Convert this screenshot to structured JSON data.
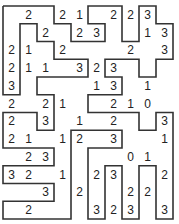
{
  "puzzle": {
    "type": "slitherlink",
    "cols": 10,
    "rows": 12,
    "line_color": "#333333",
    "clues": [
      [
        null,
        2,
        null,
        2,
        1,
        null,
        2,
        2,
        3,
        null
      ],
      [
        null,
        null,
        2,
        null,
        2,
        3,
        null,
        null,
        1,
        3
      ],
      [
        2,
        1,
        null,
        2,
        null,
        null,
        null,
        2,
        null,
        3
      ],
      [
        2,
        1,
        1,
        null,
        3,
        2,
        3,
        null,
        null,
        null
      ],
      [
        3,
        null,
        null,
        null,
        null,
        1,
        3,
        null,
        1,
        null
      ],
      [
        2,
        null,
        2,
        1,
        null,
        null,
        2,
        1,
        0,
        null
      ],
      [
        2,
        null,
        3,
        null,
        1,
        null,
        2,
        null,
        null,
        3
      ],
      [
        2,
        1,
        null,
        1,
        2,
        null,
        3,
        null,
        null,
        1
      ],
      [
        null,
        2,
        3,
        null,
        null,
        null,
        null,
        0,
        1,
        null
      ],
      [
        3,
        2,
        null,
        1,
        null,
        2,
        3,
        null,
        null,
        2
      ],
      [
        null,
        null,
        3,
        null,
        2,
        null,
        null,
        2,
        2,
        null
      ],
      [
        null,
        2,
        null,
        null,
        null,
        3,
        2,
        3,
        null,
        3
      ]
    ],
    "loop": [
      [
        0,
        0
      ],
      [
        3,
        0
      ],
      [
        3,
        1
      ],
      [
        4,
        1
      ],
      [
        4,
        2
      ],
      [
        6,
        2
      ],
      [
        6,
        1
      ],
      [
        5,
        1
      ],
      [
        5,
        0
      ],
      [
        7,
        0
      ],
      [
        7,
        2
      ],
      [
        8,
        2
      ],
      [
        8,
        0
      ],
      [
        9,
        0
      ],
      [
        9,
        1
      ],
      [
        10,
        1
      ],
      [
        10,
        3
      ],
      [
        9,
        3
      ],
      [
        9,
        4
      ],
      [
        8,
        4
      ],
      [
        8,
        3
      ],
      [
        6,
        3
      ],
      [
        6,
        4
      ],
      [
        7,
        4
      ],
      [
        7,
        5
      ],
      [
        5,
        5
      ],
      [
        5,
        6
      ],
      [
        8,
        6
      ],
      [
        8,
        7
      ],
      [
        9,
        7
      ],
      [
        9,
        6
      ],
      [
        10,
        6
      ],
      [
        10,
        12
      ],
      [
        9,
        12
      ],
      [
        9,
        9
      ],
      [
        8,
        9
      ],
      [
        8,
        12
      ],
      [
        7,
        12
      ],
      [
        7,
        9
      ],
      [
        6,
        9
      ],
      [
        6,
        12
      ],
      [
        5,
        12
      ],
      [
        5,
        8
      ],
      [
        7,
        8
      ],
      [
        7,
        7
      ],
      [
        4,
        7
      ],
      [
        4,
        12
      ],
      [
        0,
        12
      ],
      [
        0,
        11
      ],
      [
        3,
        11
      ],
      [
        3,
        10
      ],
      [
        0,
        10
      ],
      [
        0,
        9
      ],
      [
        3,
        9
      ],
      [
        3,
        8
      ],
      [
        0,
        8
      ],
      [
        0,
        6
      ],
      [
        2,
        6
      ],
      [
        2,
        7
      ],
      [
        3,
        7
      ],
      [
        3,
        5
      ],
      [
        2,
        5
      ],
      [
        2,
        4
      ],
      [
        5,
        4
      ],
      [
        5,
        3
      ],
      [
        3,
        3
      ],
      [
        3,
        2
      ],
      [
        2,
        2
      ],
      [
        2,
        1
      ],
      [
        1,
        1
      ],
      [
        1,
        5
      ],
      [
        0,
        5
      ],
      [
        0,
        0
      ]
    ]
  }
}
